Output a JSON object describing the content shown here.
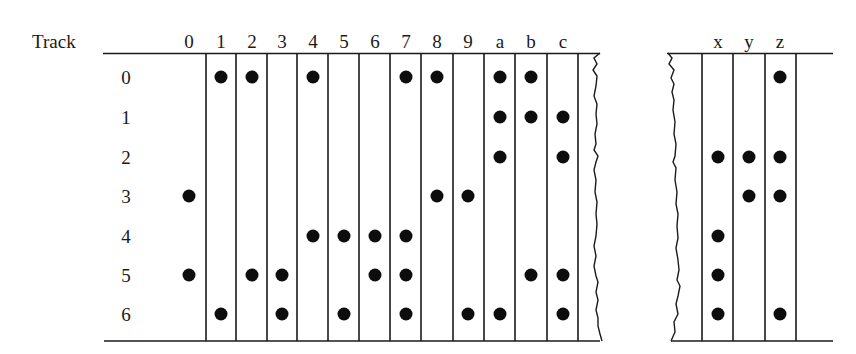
{
  "diagram": {
    "track_header": "Track",
    "columns_left": [
      "0",
      "1",
      "2",
      "3",
      "4",
      "5",
      "6",
      "7",
      "8",
      "9",
      "a",
      "b",
      "c"
    ],
    "columns_right": [
      "x",
      "y",
      "z"
    ],
    "tracks": [
      "0",
      "1",
      "2",
      "3",
      "4",
      "5",
      "6"
    ],
    "bits": {
      "0": [
        3,
        5
      ],
      "1": [
        0,
        6
      ],
      "2": [
        0,
        5
      ],
      "3": [
        5,
        6
      ],
      "4": [
        0,
        4
      ],
      "5": [
        4,
        6
      ],
      "6": [
        4,
        5
      ],
      "7": [
        0,
        4,
        5,
        6
      ],
      "8": [
        0,
        3
      ],
      "9": [
        3,
        6
      ],
      "a": [
        0,
        1,
        2,
        6
      ],
      "b": [
        0,
        1,
        5
      ],
      "c": [
        1,
        2,
        5,
        6
      ],
      "x": [
        2,
        4,
        5,
        6
      ],
      "y": [
        2,
        3
      ],
      "z": [
        0,
        2,
        3,
        6
      ]
    },
    "colors": {
      "ink": "#1a1a1a",
      "dot": "#0d0d0d",
      "background": "#ffffff"
    }
  }
}
